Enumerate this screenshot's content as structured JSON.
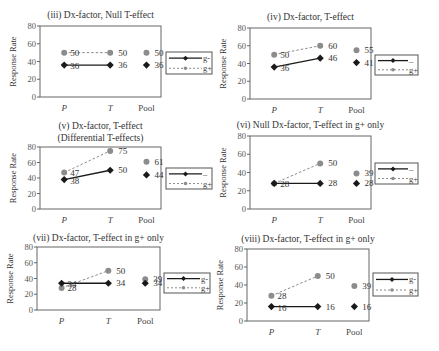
{
  "chart_data": [
    {
      "type": "line",
      "title": "(iii) Dx-factor, Null T-effect",
      "ylabel": "Response Rate",
      "ylim": [
        0,
        80
      ],
      "yticks": [
        0,
        20,
        40,
        60,
        80
      ],
      "categories": [
        "P",
        "T",
        "Pool"
      ],
      "series": [
        {
          "name": "g-",
          "values": [
            36,
            36
          ],
          "pool": 36,
          "labels": [
            "36",
            "36"
          ],
          "pool_label": "36"
        },
        {
          "name": "g+",
          "values": [
            50,
            50
          ],
          "pool": 50,
          "labels": [
            "50",
            "50"
          ],
          "pool_label": "50"
        }
      ],
      "legend": [
        "g-",
        "g+"
      ]
    },
    {
      "type": "line",
      "title": "(iv) Dx-factor, T-effect",
      "ylabel": "Response Rate",
      "ylim": [
        0,
        80
      ],
      "yticks": [
        0,
        20,
        40,
        60,
        80
      ],
      "categories": [
        "P",
        "T",
        "Pool"
      ],
      "series": [
        {
          "name": "g-",
          "values": [
            36,
            46
          ],
          "pool": 41,
          "labels": [
            "36",
            "46"
          ],
          "pool_label": "41"
        },
        {
          "name": "g+",
          "values": [
            50,
            60
          ],
          "pool": 55,
          "labels": [
            "50",
            "60"
          ],
          "pool_label": "55"
        }
      ],
      "legend": [
        "–",
        "g+"
      ]
    },
    {
      "type": "line",
      "title": "(v) Dx-factor, T-effect",
      "subtitle": "(Differential T-effects)",
      "ylabel": "Response Rate",
      "ylim": [
        0,
        80
      ],
      "yticks": [
        0,
        20,
        40,
        60,
        80
      ],
      "categories": [
        "P",
        "T",
        "Pool"
      ],
      "series": [
        {
          "name": "g-",
          "values": [
            38,
            50
          ],
          "pool": 44,
          "labels": [
            "38",
            "50"
          ],
          "pool_label": "44"
        },
        {
          "name": "g+",
          "values": [
            47,
            75
          ],
          "pool": 61,
          "labels": [
            "47",
            "75"
          ],
          "pool_label": "61"
        }
      ],
      "legend": [
        "–",
        "g+"
      ]
    },
    {
      "type": "line",
      "title": "(vi) Null Dx-factor, T-effect in g+ only",
      "ylabel": "Response Rate",
      "ylim": [
        0,
        80
      ],
      "yticks": [
        0,
        20,
        40,
        60,
        80
      ],
      "categories": [
        "P",
        "T",
        "Pool"
      ],
      "series": [
        {
          "name": "g-",
          "values": [
            28,
            28
          ],
          "pool": 28,
          "labels": [
            "28",
            "28"
          ],
          "pool_label": "28"
        },
        {
          "name": "g+",
          "values": [
            28,
            50
          ],
          "pool": 39,
          "labels": [
            "",
            "50"
          ],
          "pool_label": "39"
        }
      ],
      "legend": [
        "–",
        "g+"
      ]
    },
    {
      "type": "line",
      "title": "(vii) Dx-factor, T-effect in g+ only",
      "ylabel": "Response Rate",
      "ylim": [
        0,
        80
      ],
      "yticks": [
        0,
        20,
        40,
        60,
        80
      ],
      "categories": [
        "P",
        "T",
        "Pool"
      ],
      "series": [
        {
          "name": "g-",
          "values": [
            34,
            34
          ],
          "pool": 34,
          "labels": [
            "34",
            "34"
          ],
          "pool_label": "34"
        },
        {
          "name": "g+",
          "values": [
            28,
            50
          ],
          "pool": 39,
          "labels": [
            "28",
            "50"
          ],
          "pool_label": "39"
        }
      ],
      "legend": [
        "g-",
        "g+"
      ]
    },
    {
      "type": "line",
      "title": "(viii) Dx-factor, T-effect in g+ only",
      "ylabel": "Response Rate",
      "ylim": [
        0,
        80
      ],
      "yticks": [
        0,
        20,
        40,
        60,
        80
      ],
      "categories": [
        "P",
        "T",
        "Pool"
      ],
      "series": [
        {
          "name": "g-",
          "values": [
            16,
            16
          ],
          "pool": 16,
          "labels": [
            "16",
            "16"
          ],
          "pool_label": "16"
        },
        {
          "name": "g+",
          "values": [
            28,
            50
          ],
          "pool": 39,
          "labels": [
            "28",
            "50"
          ],
          "pool_label": "39"
        }
      ],
      "legend": [
        "g-",
        "g+"
      ]
    }
  ],
  "layout": [
    {
      "ax": 40,
      "top": 26,
      "bottom": 97,
      "right": 161,
      "titleY": 18,
      "legend": {
        "x": 166,
        "y": 52,
        "w": 46,
        "h": 22
      }
    },
    {
      "ax": 250,
      "top": 28,
      "bottom": 99,
      "right": 371,
      "titleY": 20,
      "legend": {
        "x": 375,
        "y": 55,
        "w": 43,
        "h": 20
      }
    },
    {
      "ax": 40,
      "top": 147,
      "bottom": 209,
      "right": 161,
      "titleY": 129,
      "titleY2": 141,
      "legend": {
        "x": 166,
        "y": 168,
        "w": 46,
        "h": 21
      }
    },
    {
      "ax": 250,
      "top": 136,
      "bottom": 209,
      "right": 371,
      "titleY": 128,
      "legend": {
        "x": 375,
        "y": 163,
        "w": 43,
        "h": 21
      }
    },
    {
      "ax": 37,
      "top": 247,
      "bottom": 310,
      "right": 160,
      "titleY": 241,
      "legend": {
        "x": 164,
        "y": 273,
        "w": 46,
        "h": 20
      }
    },
    {
      "ax": 247,
      "top": 249,
      "bottom": 321,
      "right": 369,
      "titleY": 242,
      "legend": {
        "x": 373,
        "y": 273,
        "w": 45,
        "h": 23
      }
    }
  ],
  "colors": {
    "gminus": "#1a1a1a",
    "gplus": "#8c8c8c",
    "axis": "#666666"
  }
}
